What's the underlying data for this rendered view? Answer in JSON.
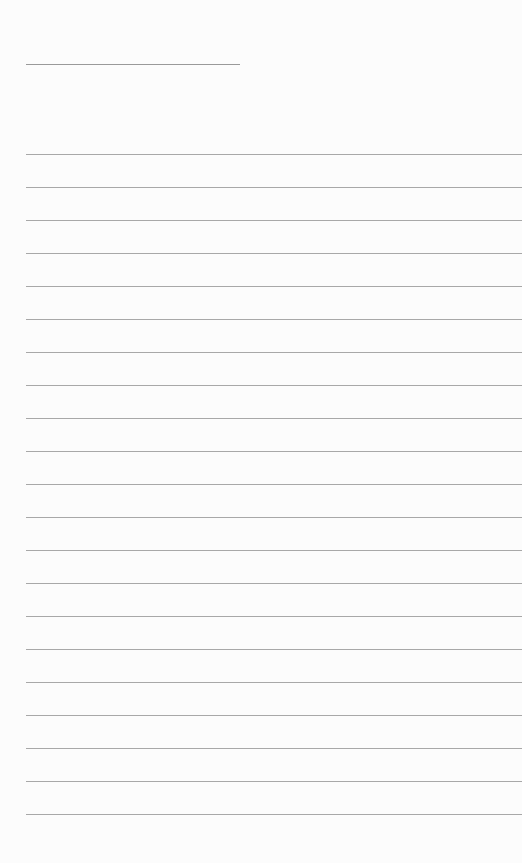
{
  "page": {
    "type": "lined-paper",
    "background_color": "#fcfcfc",
    "line_color": "#a8a8a8"
  },
  "header": {
    "name_line": {
      "text": ""
    }
  },
  "body": {
    "line_count": 21,
    "first_line_y": 154,
    "line_spacing": 33,
    "lines": [
      "",
      "",
      "",
      "",
      "",
      "",
      "",
      "",
      "",
      "",
      "",
      "",
      "",
      "",
      "",
      "",
      "",
      "",
      "",
      "",
      ""
    ]
  }
}
